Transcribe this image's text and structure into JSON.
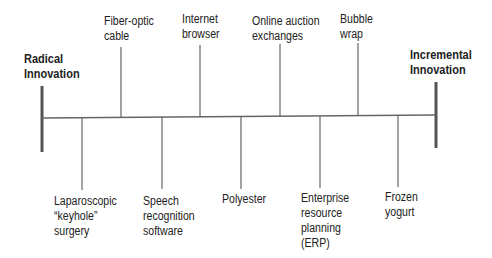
{
  "diagram": {
    "left_end": "Radical\nInnovation",
    "right_end": "Incremental\nInnovation",
    "above": [
      {
        "label": "Fiber-optic\ncable"
      },
      {
        "label": "Internet\nbrowser"
      },
      {
        "label": "Online auction\nexchanges"
      },
      {
        "label": "Bubble\nwrap"
      }
    ],
    "below": [
      {
        "label": "Laparoscopic\n“keyhole”\nsurgery"
      },
      {
        "label": "Speech\nrecognition\nsoftware"
      },
      {
        "label": "Polyester"
      },
      {
        "label": "Enterprise\nresource\nplanning\n(ERP)"
      },
      {
        "label": "Frozen\nyogurt"
      }
    ],
    "colors": {
      "axis": "#555555",
      "text": "#222222"
    }
  }
}
